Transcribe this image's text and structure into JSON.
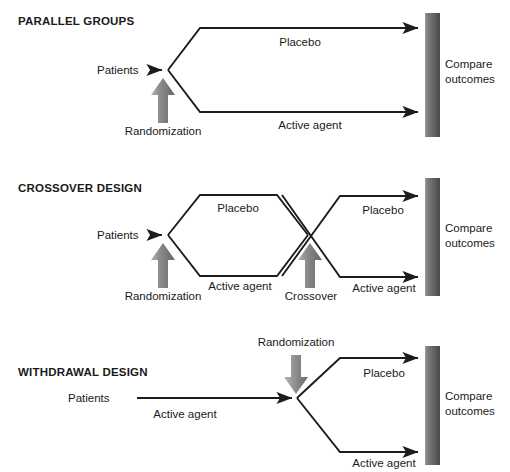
{
  "diagram": {
    "title_hidden": "",
    "sections": [
      {
        "id": "parallel-groups",
        "title": "PARALLEL GROUPS",
        "entry_label": "Patients",
        "randomization_label": "Randomization",
        "crossover_label": "",
        "branch_labels": [
          "Placebo",
          "Active agent"
        ],
        "second_stage_labels": [],
        "outcome_label_line1": "Compare",
        "outcome_label_line2": "outcomes"
      },
      {
        "id": "crossover-design",
        "title": "CROSSOVER DESIGN",
        "entry_label": "Patients",
        "randomization_label": "Randomization",
        "crossover_label": "Crossover",
        "branch_labels": [
          "Placebo",
          "Active agent"
        ],
        "second_stage_labels": [
          "Placebo",
          "Active agent"
        ],
        "outcome_label_line1": "Compare",
        "outcome_label_line2": "outcomes"
      },
      {
        "id": "withdrawal-design",
        "title": "WITHDRAWAL DESIGN",
        "entry_label": "Patients",
        "randomization_label": "Randomization",
        "crossover_label": "",
        "branch_labels": [
          "Active agent"
        ],
        "second_stage_labels": [
          "Placebo",
          "Active agent"
        ],
        "outcome_label_line1": "Compare",
        "outcome_label_line2": "outcomes"
      }
    ]
  },
  "colors": {
    "line": "#1c1c1c",
    "text": "#1a1a1a",
    "block_arrow_light": "#9a9a9a",
    "block_arrow_dark": "#6e6e6e",
    "bar_light": "#8f8f8f",
    "bar_dark": "#4f4f4f",
    "background": "#ffffff"
  },
  "icons": {
    "up_block_arrow": "block-arrow-up-icon",
    "down_block_arrow": "block-arrow-down-icon",
    "outcome_bar": "outcome-gradient-bar-icon",
    "flow_arrowhead": "arrowhead-icon"
  }
}
